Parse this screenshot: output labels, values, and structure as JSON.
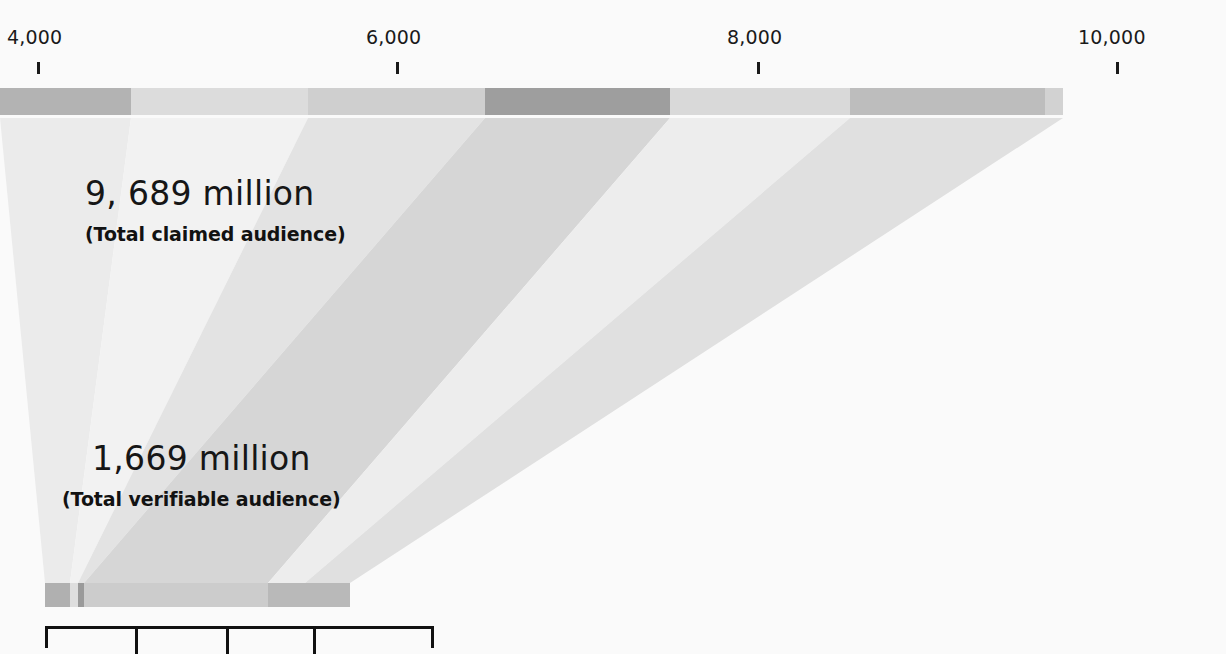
{
  "chart_data": {
    "type": "bar",
    "title": "",
    "subtitle": "",
    "xlabel": "",
    "ylabel": "",
    "grid": false,
    "legend_position": "none",
    "axis": {
      "orientation": "horizontal-top",
      "ticks": [
        {
          "label": "4,000",
          "value": 4000,
          "x": 37
        },
        {
          "label": "6,000",
          "value": 6000,
          "x": 396
        },
        {
          "label": "8,000",
          "value": 8000,
          "x": 757
        },
        {
          "label": "10,000",
          "value": 10000,
          "x": 1116
        }
      ],
      "range": [
        4000,
        10000
      ],
      "units": "million"
    },
    "annotations": [
      {
        "name": "total-claimed-audience",
        "value_label": "9, 689 million",
        "value": 9689,
        "description": "(Total claimed audience)"
      },
      {
        "name": "total-verifiable-audience",
        "value_label": "1,669 million",
        "value": 1669,
        "description": "(Total verifiable audience)"
      }
    ],
    "series": [
      {
        "name": "claimed-audience-bar",
        "total": 9689,
        "bar_position": "top",
        "segments": [
          {
            "name": "segment-1",
            "start_px": 0,
            "end_px": 131,
            "color": "#b3b3b3"
          },
          {
            "name": "segment-2",
            "start_px": 131,
            "end_px": 308,
            "color": "#dcdcdc"
          },
          {
            "name": "segment-3",
            "start_px": 308,
            "end_px": 485,
            "color": "#cfcfcf"
          },
          {
            "name": "segment-4",
            "start_px": 485,
            "end_px": 670,
            "color": "#9e9e9e"
          },
          {
            "name": "segment-5",
            "start_px": 670,
            "end_px": 850,
            "color": "#d9d9d9"
          },
          {
            "name": "segment-6",
            "start_px": 850,
            "end_px": 1045,
            "color": "#bdbdbd"
          },
          {
            "name": "segment-7",
            "start_px": 1045,
            "end_px": 1063,
            "color": "#d2d2d2"
          }
        ]
      },
      {
        "name": "verifiable-audience-bar",
        "total": 1669,
        "bar_position": "bottom",
        "segments": [
          {
            "name": "segment-1",
            "start_px": 0,
            "end_px": 25,
            "color": "#b0b0b0"
          },
          {
            "name": "segment-2",
            "start_px": 25,
            "end_px": 33,
            "color": "#dedede"
          },
          {
            "name": "segment-3",
            "start_px": 33,
            "end_px": 39,
            "color": "#9a9a9a"
          },
          {
            "name": "segment-4",
            "start_px": 39,
            "end_px": 223,
            "color": "#cccccc"
          },
          {
            "name": "segment-5",
            "start_px": 223,
            "end_px": 305,
            "color": "#b9b9b9"
          }
        ]
      }
    ],
    "funnel_rays": [
      {
        "name": "ray-1",
        "top_start": 0,
        "top_end": 131,
        "bottom_start": 45,
        "bottom_end": 70,
        "color": "#ebebeb"
      },
      {
        "name": "ray-2",
        "top_start": 131,
        "top_end": 308,
        "bottom_start": 70,
        "bottom_end": 78,
        "color": "#f2f2f2"
      },
      {
        "name": "ray-3",
        "top_start": 308,
        "top_end": 485,
        "bottom_start": 78,
        "bottom_end": 84,
        "color": "#e3e3e3"
      },
      {
        "name": "ray-4",
        "top_start": 485,
        "top_end": 670,
        "bottom_start": 84,
        "bottom_end": 268,
        "color": "#d6d6d6"
      },
      {
        "name": "ray-5",
        "top_start": 670,
        "top_end": 850,
        "bottom_start": 268,
        "bottom_end": 305,
        "color": "#ededed"
      },
      {
        "name": "ray-6",
        "top_start": 850,
        "top_end": 1063,
        "bottom_start": 305,
        "bottom_end": 350,
        "color": "#e0e0e0"
      }
    ],
    "bracket": {
      "name": "category-bracket",
      "left_px": 45,
      "right_px": 434,
      "dividers_px": [
        135,
        226,
        313
      ]
    },
    "colors": {
      "background": "#fafafa",
      "text": "#161616",
      "rule": "#111111"
    }
  }
}
